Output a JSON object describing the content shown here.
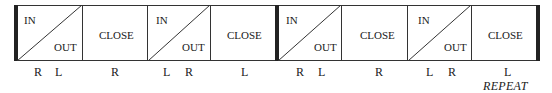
{
  "diagram": {
    "type": "bar-rhythm-diagram",
    "cells": [
      {
        "kind": "split",
        "top_left": "IN",
        "bottom_right": "OUT",
        "feet": [
          "R",
          "L"
        ]
      },
      {
        "kind": "close",
        "label": "CLOSE",
        "feet": [
          "R"
        ]
      },
      {
        "kind": "split",
        "top_left": "IN",
        "bottom_right": "OUT",
        "feet": [
          "L",
          "R"
        ]
      },
      {
        "kind": "close",
        "label": "CLOSE",
        "feet": [
          "L"
        ]
      },
      {
        "kind": "split",
        "top_left": "IN",
        "bottom_right": "OUT",
        "feet": [
          "R",
          "L"
        ]
      },
      {
        "kind": "close",
        "label": "CLOSE",
        "feet": [
          "R"
        ]
      },
      {
        "kind": "split",
        "top_left": "IN",
        "bottom_right": "OUT",
        "feet": [
          "L",
          "R"
        ]
      },
      {
        "kind": "close",
        "label": "CLOSE",
        "feet": [
          "L"
        ]
      }
    ],
    "footer_note": "REPEAT",
    "colors": {
      "line": "#333333",
      "bar": "#222222",
      "text": "#1a1a1a"
    }
  }
}
